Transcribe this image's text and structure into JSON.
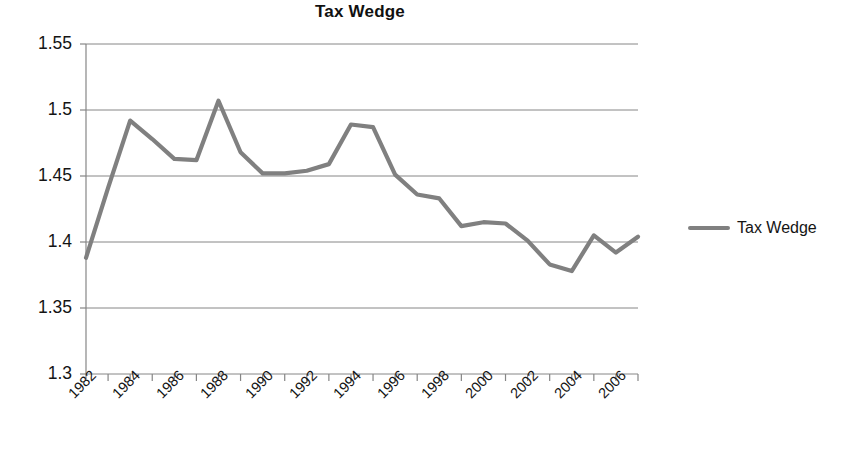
{
  "chart_data": {
    "type": "line",
    "title": "Tax Wedge",
    "xlabel": "",
    "ylabel": "",
    "grid": true,
    "legend_position": "right",
    "xlim": [
      1982,
      2007
    ],
    "ylim": [
      1.3,
      1.55
    ],
    "ytick_labels": [
      "1.55",
      "1.5",
      "1.45",
      "1.4",
      "1.35",
      "1.3"
    ],
    "ytick_values": [
      1.55,
      1.5,
      1.45,
      1.4,
      1.35,
      1.3
    ],
    "xtick_labels": [
      "1982",
      "1984",
      "1986",
      "1988",
      "1990",
      "1992",
      "1994",
      "1996",
      "1998",
      "2000",
      "2002",
      "2004",
      "2006"
    ],
    "x": [
      1982,
      1983,
      1984,
      1985,
      1986,
      1987,
      1988,
      1989,
      1990,
      1991,
      1992,
      1993,
      1994,
      1995,
      1996,
      1997,
      1998,
      1999,
      2000,
      2001,
      2002,
      2003,
      2004,
      2005,
      2006,
      2007
    ],
    "series": [
      {
        "name": "Tax Wedge",
        "color": "#808080",
        "values": [
          1.388,
          1.441,
          1.492,
          1.478,
          1.463,
          1.462,
          1.507,
          1.468,
          1.452,
          1.452,
          1.454,
          1.459,
          1.489,
          1.487,
          1.451,
          1.436,
          1.433,
          1.412,
          1.415,
          1.414,
          1.401,
          1.383,
          1.378,
          1.405,
          1.392,
          1.404
        ]
      }
    ]
  },
  "legend": {
    "entries": [
      {
        "label": "Tax Wedge",
        "color": "#808080"
      }
    ]
  },
  "colors": {
    "line": "#808080",
    "grid": "#868686",
    "axis": "#868686",
    "text": "#141414"
  }
}
